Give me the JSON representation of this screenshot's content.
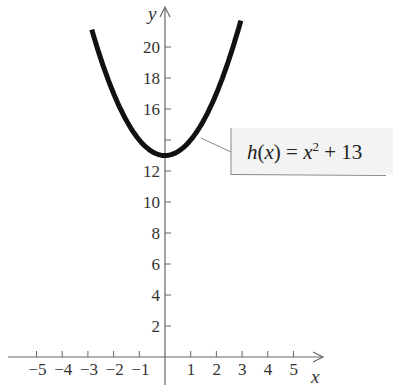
{
  "chart_data": {
    "type": "line",
    "title": "",
    "function_label": "h(x) = x² + 13",
    "function_label_parts": {
      "lhs": "h(x) = x",
      "exp": "2",
      "rhs": " + 13"
    },
    "xlabel": "x",
    "ylabel": "y",
    "x_ticks": [
      "−5",
      "−4",
      "−3",
      "−2",
      "−1",
      "1",
      "2",
      "3",
      "4",
      "5"
    ],
    "x_tick_values": [
      -5,
      -4,
      -3,
      -2,
      -1,
      1,
      2,
      3,
      4,
      5
    ],
    "y_ticks": [
      "2",
      "4",
      "6",
      "8",
      "10",
      "12",
      "14",
      "16",
      "18",
      "20"
    ],
    "y_tick_labels_shown": [
      "2",
      "4",
      "6",
      "8",
      "10",
      "12",
      "",
      "16",
      "18",
      "20"
    ],
    "y_tick_values": [
      2,
      4,
      6,
      8,
      10,
      12,
      14,
      16,
      18,
      20
    ],
    "xlim": [
      -6,
      6
    ],
    "ylim": [
      0,
      22
    ],
    "grid": false,
    "series": [
      {
        "name": "h(x) = x^2 + 13",
        "x": [
          -2.85,
          -2.5,
          -2,
          -1.5,
          -1,
          -0.5,
          0,
          0.5,
          1,
          1.5,
          2,
          2.5,
          2.95
        ],
        "y": [
          21.12,
          19.25,
          17,
          15.25,
          14,
          13.25,
          13,
          13.25,
          14,
          15.25,
          17,
          19.25,
          21.7
        ]
      }
    ],
    "vertex": [
      0,
      13
    ],
    "colors": {
      "curve": "#111111",
      "axis": "#666666",
      "label_box": "#f3f3f3"
    }
  }
}
